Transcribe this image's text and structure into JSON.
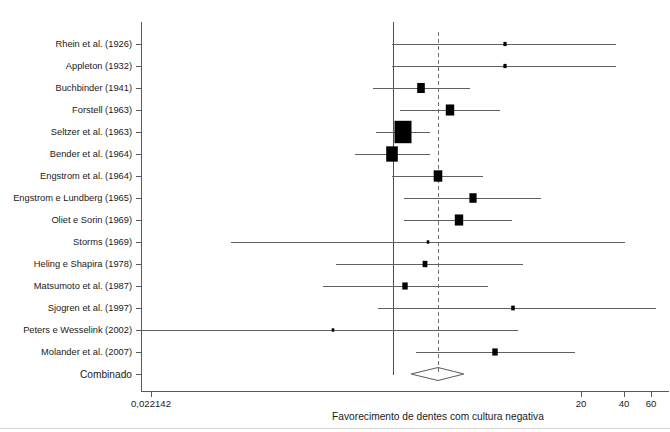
{
  "figure": {
    "type": "forest-plot",
    "pooled_row_label": "Combinado",
    "x_axis_title": "Favorecimento de dentes com cultura negativa"
  },
  "chart_data": {
    "type": "forest",
    "title": "",
    "xlabel": "Favorecimento de dentes com cultura negativa",
    "ylabel": "",
    "scale": "log",
    "x_tick_labels": [
      "0,022142",
      "20",
      "40",
      "60"
    ],
    "x_tick_values": [
      0.022142,
      20,
      40,
      60
    ],
    "x_tick_px": [
      151,
      581,
      624,
      651
    ],
    "null_line_px": 393,
    "pooled_line_px": 438,
    "label_axis_px": 141,
    "legend": "",
    "grid": false,
    "categories": [
      "Rhein et al. (1926)",
      "Appleton (1932)",
      "Buchbinder (1941)",
      "Forstell (1963)",
      "Seltzer et al. (1963)",
      "Bender et al. (1964)",
      "Engstrom et al. (1964)",
      "Engstrom e Lundberg (1965)",
      "Oliet e Sorin (1969)",
      "Storms (1969)",
      "Heling e Shapira (1978)",
      "Matsumoto et al. (1987)",
      "Sjogren et al. (1997)",
      "Peters e Wesselink (2002)",
      "Molander et al. (2007)"
    ],
    "rows": [
      {
        "label": "Rhein et al. (1926)",
        "y": 44,
        "est_px": 505,
        "lo_px": 392,
        "hi_px": 616,
        "box": 3.2
      },
      {
        "label": "Appleton (1932)",
        "y": 66,
        "est_px": 505,
        "lo_px": 392,
        "hi_px": 616,
        "box": 3.2
      },
      {
        "label": "Buchbinder (1941)",
        "y": 88,
        "est_px": 421,
        "lo_px": 373,
        "hi_px": 470,
        "box": 7.6
      },
      {
        "label": "Forstell (1963)",
        "y": 110,
        "est_px": 450,
        "lo_px": 400,
        "hi_px": 500,
        "box": 8.4
      },
      {
        "label": "Seltzer et al. (1963)",
        "y": 132,
        "est_px": 403,
        "lo_px": 376,
        "hi_px": 430,
        "box": 17.0
      },
      {
        "label": "Bender et al. (1964)",
        "y": 154,
        "est_px": 392,
        "lo_px": 355,
        "hi_px": 430,
        "box": 11.6
      },
      {
        "label": "Engstrom et al. (1964)",
        "y": 176,
        "est_px": 438,
        "lo_px": 392,
        "hi_px": 483,
        "box": 8.6
      },
      {
        "label": "Engstrom e Lundberg (1965)",
        "y": 198,
        "est_px": 473,
        "lo_px": 404,
        "hi_px": 541,
        "box": 7.2
      },
      {
        "label": "Oliet e Sorin (1969)",
        "y": 220,
        "est_px": 459,
        "lo_px": 404,
        "hi_px": 512,
        "box": 8.4
      },
      {
        "label": "Storms (1969)",
        "y": 242,
        "est_px": 428,
        "lo_px": 231,
        "hi_px": 625,
        "box": 2.6
      },
      {
        "label": "Heling e Shapira (1978)",
        "y": 264,
        "est_px": 425,
        "lo_px": 336,
        "hi_px": 523,
        "box": 4.8
      },
      {
        "label": "Matsumoto et al. (1987)",
        "y": 286,
        "est_px": 405,
        "lo_px": 323,
        "hi_px": 488,
        "box": 5.4
      },
      {
        "label": "Sjogren et al. (1997)",
        "y": 308,
        "est_px": 513,
        "lo_px": 378,
        "hi_px": 656,
        "box": 3.6
      },
      {
        "label": "Peters e Wesselink (2002)",
        "y": 330,
        "est_px": 333,
        "lo_px": 141,
        "hi_px": 518,
        "box": 2.6
      },
      {
        "label": "Molander et al. (2007)",
        "y": 352,
        "est_px": 495,
        "lo_px": 416,
        "hi_px": 575,
        "box": 5.4
      }
    ],
    "pooled": {
      "label": "Combinado",
      "y": 374,
      "est_px": 438,
      "lo_px": 411,
      "hi_px": 464
    }
  }
}
